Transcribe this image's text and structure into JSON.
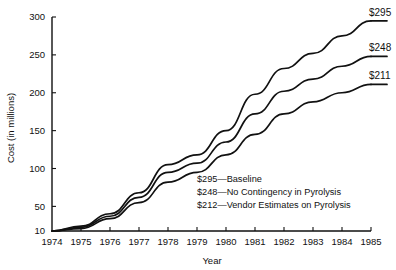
{
  "chart_data": {
    "type": "line",
    "title": "",
    "xlabel": "Year",
    "ylabel": "Cost (in millions)",
    "x": [
      1974,
      1975,
      1976,
      1977,
      1978,
      1979,
      1980,
      1981,
      1982,
      1983,
      1984,
      1985
    ],
    "xlim": [
      1974,
      1985
    ],
    "ylim": [
      10,
      300
    ],
    "grid": false,
    "legend_position": "inside-center-bottom",
    "xticks": [
      "1974",
      "1975",
      "1976",
      "1977",
      "1978",
      "1979",
      "1980",
      "1981",
      "1982",
      "1983",
      "1984",
      "1985"
    ],
    "yticks": [
      "10",
      "50",
      "100",
      "150",
      "200",
      "250",
      "300"
    ],
    "ytick_values": [
      10,
      50,
      100,
      150,
      200,
      250,
      300
    ],
    "series": [
      {
        "name": "Baseline",
        "end_label": "$295",
        "values": [
          10,
          18,
          38,
          68,
          105,
          118,
          150,
          198,
          232,
          252,
          275,
          295
        ]
      },
      {
        "name": "No Contingency in Pyrolysis",
        "end_label": "$248",
        "values": [
          10,
          16,
          34,
          62,
          95,
          107,
          135,
          172,
          202,
          218,
          235,
          248
        ]
      },
      {
        "name": "Vendor Estimates on Pyrolysis",
        "end_label": "$211",
        "values": [
          10,
          14,
          30,
          55,
          82,
          95,
          118,
          145,
          172,
          188,
          200,
          211
        ]
      }
    ],
    "annotations": [
      "$295—Baseline",
      "$248—No Contingency in Pyrolysis",
      "$212—Vendor Estimates on Pyrolysis"
    ]
  },
  "colors": {
    "line": "#111111",
    "axis": "#111111",
    "background": "#ffffff"
  }
}
